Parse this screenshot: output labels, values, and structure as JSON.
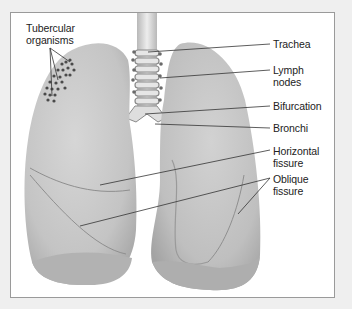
{
  "figure": {
    "labels": {
      "tubercular": "Tubercular\norganisms",
      "trachea": "Trachea",
      "lymph": "Lymph\nnodes",
      "bifurcation": "Bifurcation",
      "bronchi": "Bronchi",
      "horizontal": "Horizontal\nfissure",
      "oblique": "Oblique\nfissure"
    },
    "colors": {
      "background": "#efefef",
      "panel": "#ffffff",
      "lung": "#c9c9c9",
      "lung_shadow": "#a9a9a9",
      "leader_line": "#333333"
    }
  }
}
